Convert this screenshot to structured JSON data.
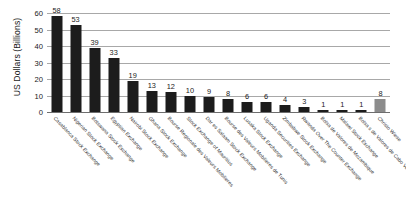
{
  "chart_data": {
    "type": "bar",
    "title": "",
    "xlabel": "",
    "ylabel": "US Dollars (Billions)",
    "ylim": [
      0,
      60
    ],
    "yticks": [
      0,
      10,
      20,
      30,
      40,
      50,
      60
    ],
    "grid": true,
    "legend": "none",
    "orientation": "vertical",
    "bar_color": "#1c1c1c",
    "highlight_color": "#8c8c8c",
    "highlight_index": 17,
    "categories": [
      "Casablanca Stock Exchange",
      "Nigerian Stock Exchange",
      "Botswana Stock Exchange",
      "Egyptian Exchange",
      "Nairobi Stock Exchange",
      "Ghana Stock Exchange",
      "Bourse Regionale des Valeurs Mobilieres",
      "Stock Exchange of Mauritius",
      "Dar es Salaam Stock Exchange",
      "Bourse des Valeurs Mobilieres de Tunis",
      "Lusaka Stock Exchange",
      "Uganda Securities Exchange",
      "Zimbabwe Stock Exchange",
      "Rwanda Over The Counter Exchange",
      "Bolsa de Valores de Mozambique",
      "Malawi Stock Exchange",
      "Bolsa s de Valores de Cabo Verde",
      "Christo Wiese"
    ],
    "values": [
      58,
      53,
      39,
      33,
      19,
      13,
      12,
      10,
      9,
      8,
      6,
      6,
      4,
      3,
      1,
      1,
      1,
      8
    ]
  }
}
